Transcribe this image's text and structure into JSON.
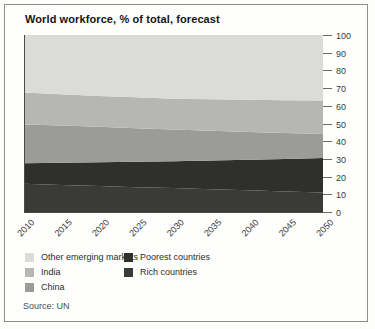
{
  "card": {
    "title": "World workforce, % of total, forecast",
    "source": "Source: UN"
  },
  "chart_data": {
    "type": "area",
    "stacked": true,
    "title": "World workforce, % of total, forecast",
    "source": "Source: UN",
    "x": [
      "2010",
      "2015",
      "2020",
      "2025",
      "2030",
      "2035",
      "2040",
      "2045",
      "2050"
    ],
    "ylim": [
      0,
      100
    ],
    "yticks": [
      0,
      10,
      20,
      30,
      40,
      50,
      60,
      70,
      80,
      90,
      100
    ],
    "y_axis_side": "right",
    "series": [
      {
        "name": "Rich countries",
        "color": "#3a3a38",
        "values": [
          16,
          15.3,
          14.7,
          14,
          13.5,
          12.9,
          12.3,
          11.6,
          11
        ]
      },
      {
        "name": "Poorest countries",
        "color": "#2f2f2d",
        "values": [
          11.5,
          12.5,
          13.4,
          14.4,
          15.2,
          16.2,
          17.2,
          18.4,
          19.5
        ]
      },
      {
        "name": "China",
        "color": "#9b9b99",
        "values": [
          22,
          21,
          20,
          18.9,
          17.9,
          16.8,
          15.7,
          14.6,
          13.5
        ]
      },
      {
        "name": "India",
        "color": "#b6b6b4",
        "values": [
          18,
          17.7,
          17.5,
          17.5,
          17.4,
          17.8,
          18.2,
          18.6,
          19
        ]
      },
      {
        "name": "Other emerging markets",
        "color": "#dbdbd9",
        "values": [
          32.5,
          33.5,
          34.4,
          35.2,
          36,
          36.3,
          36.6,
          36.8,
          37
        ]
      }
    ],
    "legend": [
      {
        "label": "Other emerging markets",
        "color": "#dbdbd9",
        "col": 0
      },
      {
        "label": "India",
        "color": "#b6b6b4",
        "col": 0
      },
      {
        "label": "China",
        "color": "#9b9b99",
        "col": 0
      },
      {
        "label": "Poorest countries",
        "color": "#2f2f2d",
        "col": 1
      },
      {
        "label": "Rich countries",
        "color": "#3a3a38",
        "col": 1
      }
    ],
    "axis_colors": {
      "axis_line": "#4a4a48",
      "tick_line": "#6a6a68",
      "tick_label": "#3a3a3a"
    }
  }
}
